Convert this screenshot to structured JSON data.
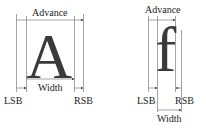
{
  "left_figure": {
    "glyph": "A",
    "labels": {
      "advance": "Advance",
      "width": "Width",
      "lsb": "LSB",
      "rsb": "RSB"
    }
  },
  "right_figure": {
    "glyph": "f",
    "labels": {
      "advance": "Advance",
      "width": "Width",
      "lsb": "LSB",
      "rsb": "RSB"
    }
  },
  "colors": {
    "line": "#555555",
    "glyph": "#3a3a3a"
  }
}
